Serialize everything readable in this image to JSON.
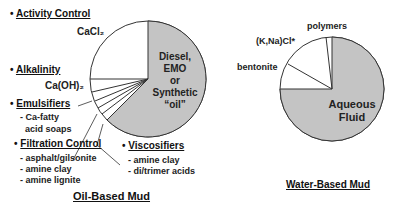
{
  "oil_based": {
    "title": "Oil-Based Mud",
    "center_label": [
      "Diesel,",
      "EMO",
      "or",
      "Synthetic",
      "“oil”"
    ],
    "categories": [
      {
        "heading": "Activity Control",
        "items": [
          "CaCl₂"
        ]
      },
      {
        "heading": "Alkalinity",
        "items": [
          "Ca(OH)₂"
        ]
      },
      {
        "heading": "Emulsifiers",
        "items": [
          "- Ca-fatty",
          "acid soaps"
        ]
      },
      {
        "heading": "Filtration Control",
        "items": [
          "- asphalt/gilsonite",
          "- amine clay",
          "- amine lignite"
        ]
      },
      {
        "heading": "Viscosifiers",
        "items": [
          "- amine clay",
          "- di/trimer acids"
        ]
      }
    ]
  },
  "water_based": {
    "title": "Water-Based Mud",
    "center_label": [
      "Aqueous",
      "Fluid"
    ],
    "slices": [
      "bentonite",
      "(K,Na)Cl*",
      "polymers"
    ]
  },
  "colors": {
    "fluid": "#c4c4c4",
    "additive": "#ffffff",
    "line": "#333333"
  },
  "bullet": "•"
}
